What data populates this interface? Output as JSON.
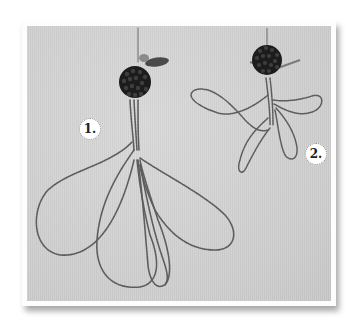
{
  "photo": {
    "subject": "beaded wire flower components",
    "background_color": "#d3d3d3",
    "wire_color": "#5a5a5a",
    "bead_color": "#1c1c1c"
  },
  "labels": {
    "step1": "1.",
    "step2": "2."
  },
  "items": [
    {
      "label": "1.",
      "description": "bead ball with long twisted wire loops (five petals)"
    },
    {
      "label": "2.",
      "description": "bead ball with short twisted wire loops (four petals)"
    }
  ]
}
